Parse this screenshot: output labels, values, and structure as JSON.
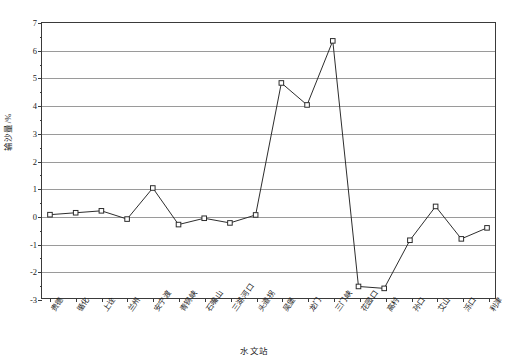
{
  "chart_data": {
    "type": "line",
    "title": "",
    "xlabel": "水文站",
    "ylabel": "输沙量/%",
    "ylim": [
      -3,
      7
    ],
    "ytick_step": 1,
    "yticks": [
      7,
      6,
      5,
      4,
      3,
      2,
      1,
      0,
      -1,
      -2,
      -3
    ],
    "ytick_labels": [
      "7",
      "6",
      "5",
      "4",
      "3",
      "2",
      "1",
      "0",
      "-1",
      "-2",
      "-3"
    ],
    "grid": true,
    "grid_axis": "y",
    "legend": "none",
    "marker": "open-square",
    "line_color": "#2b2b2b",
    "marker_face_color": "#ffffff",
    "grid_color": "#9a9a9a",
    "categories": [
      "贵德",
      "循化",
      "上诠",
      "兰州",
      "安宁渡",
      "青铜峡",
      "石嘴山",
      "三湖河口",
      "头道拐",
      "吴堡",
      "龙门",
      "三门峡",
      "花园口",
      "高村",
      "孙口",
      "艾山",
      "泺口",
      "利津"
    ],
    "values": [
      0.03,
      0.1,
      0.17,
      -0.13,
      1.0,
      -0.33,
      -0.1,
      -0.27,
      0.02,
      4.82,
      4.02,
      6.35,
      -2.58,
      -2.65,
      -0.9,
      0.33,
      -0.85,
      -0.45
    ],
    "series": [
      {
        "name": "输沙量",
        "values": [
          0.03,
          0.1,
          0.17,
          -0.13,
          1.0,
          -0.33,
          -0.1,
          -0.27,
          0.02,
          4.82,
          4.02,
          6.35,
          -2.58,
          -2.65,
          -0.9,
          0.33,
          -0.85,
          -0.45
        ]
      }
    ]
  }
}
